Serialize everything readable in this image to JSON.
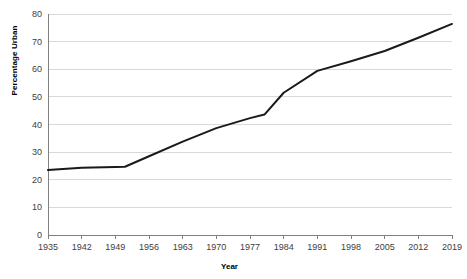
{
  "chart_data": {
    "type": "line",
    "title": "",
    "xlabel": "Year",
    "ylabel": "Percentage Urban",
    "xlim": [
      1935,
      2019
    ],
    "ylim": [
      0,
      80
    ],
    "grid": true,
    "legend": "none",
    "line_color": "#1a1a1a",
    "gridline_color": "#d9d9d9",
    "axis_color": "#808080",
    "y_ticks": [
      0,
      10,
      20,
      30,
      40,
      50,
      60,
      70,
      80
    ],
    "x_ticks": [
      1935,
      1942,
      1949,
      1956,
      1963,
      1970,
      1977,
      1984,
      1991,
      1998,
      2005,
      2012,
      2019
    ],
    "x_tick_labels": [
      "1935",
      "1942",
      "1949",
      "1956",
      "1963",
      "1970",
      "1977",
      "1984",
      "1991",
      "1998",
      "2005",
      "2012",
      "2019"
    ],
    "y_tick_labels": [
      "0",
      "10",
      "20",
      "30",
      "40",
      "50",
      "60",
      "70",
      "80"
    ],
    "x": [
      1935,
      1942,
      1949,
      1951,
      1956,
      1963,
      1970,
      1977,
      1980,
      1984,
      1991,
      1998,
      2005,
      2012,
      2019
    ],
    "values": [
      23.5,
      24.3,
      24.6,
      24.7,
      28.5,
      33.8,
      38.7,
      42.3,
      43.6,
      51.5,
      59.4,
      62.9,
      66.6,
      71.4,
      76.4
    ],
    "series": [
      {
        "name": "Percentage Urban",
        "values": [
          23.5,
          24.3,
          24.6,
          24.7,
          28.5,
          33.8,
          38.7,
          42.3,
          43.6,
          51.5,
          59.4,
          62.9,
          66.6,
          71.4,
          76.4
        ]
      }
    ]
  },
  "plot_geometry": {
    "left": 48,
    "right": 452,
    "top": 14,
    "bottom": 235
  }
}
